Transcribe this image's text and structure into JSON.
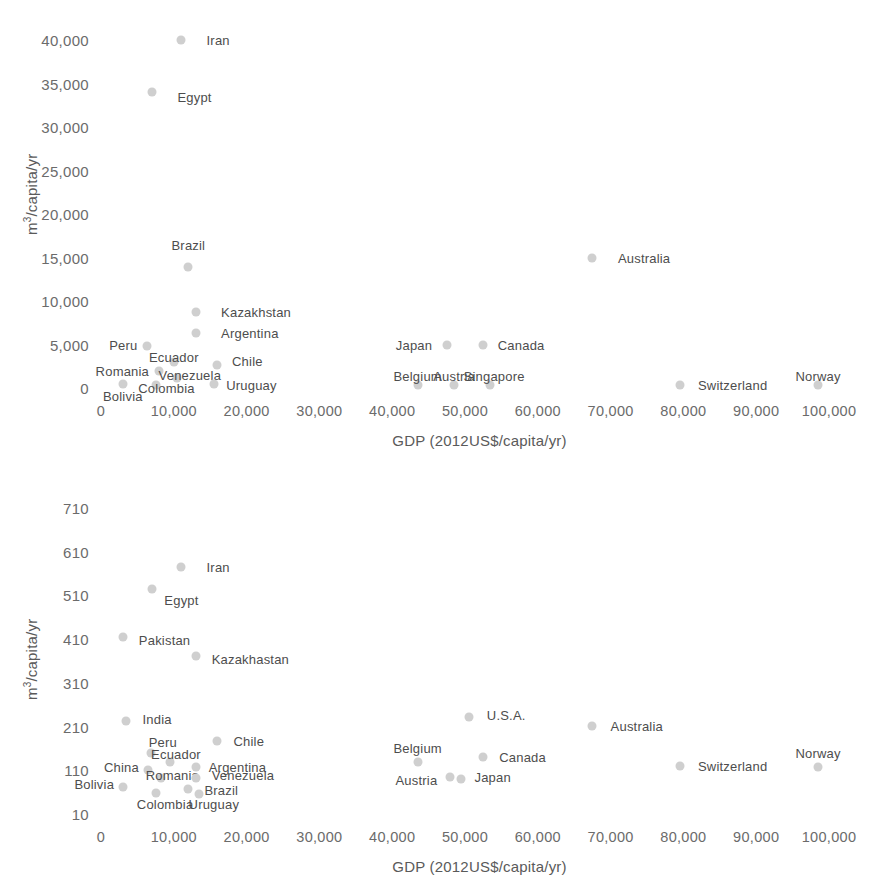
{
  "figure": {
    "background": "#ffffff",
    "marker_color": "#cfcfcf",
    "label_color": "#4d4d4d",
    "tick_color": "#6b6b6b"
  },
  "chart_data": [
    {
      "type": "scatter",
      "title": "",
      "xlabel": "GDP (2012US$/capita/yr)",
      "ylabel": "m3/capita/yr",
      "ylabel_html": "m<sup>3</sup>/capita/yr",
      "xlim": [
        0,
        100000
      ],
      "ylim": [
        0,
        40000
      ],
      "xticks": [
        "0",
        "10,000",
        "20,000",
        "30,000",
        "40,000",
        "50,000",
        "60,000",
        "70,000",
        "80,000",
        "90,000",
        "100,000"
      ],
      "xtick_values": [
        0,
        10000,
        20000,
        30000,
        40000,
        50000,
        60000,
        70000,
        80000,
        90000,
        100000
      ],
      "yticks": [
        "0",
        "5,000",
        "10,000",
        "15,000",
        "20,000",
        "25,000",
        "30,000",
        "35,000",
        "40,000"
      ],
      "ytick_values": [
        0,
        5000,
        10000,
        15000,
        20000,
        25000,
        30000,
        35000,
        40000
      ],
      "grid": false,
      "legend": "none",
      "points": [
        {
          "label": "Iran",
          "x": 11000,
          "y": 40000,
          "lx": 14500,
          "ly": 40000,
          "align": "right"
        },
        {
          "label": "Egypt",
          "x": 7000,
          "y": 34000,
          "lx": 10500,
          "ly": 33400,
          "align": "right"
        },
        {
          "label": "Brazil",
          "x": 12000,
          "y": 13900,
          "lx": 12000,
          "ly": 16400,
          "align": "center"
        },
        {
          "label": "Australia",
          "x": 67500,
          "y": 15000,
          "lx": 71000,
          "ly": 15000,
          "align": "right"
        },
        {
          "label": "Kazakhstan",
          "x": 13000,
          "y": 8700,
          "lx": 16500,
          "ly": 8700,
          "align": "right"
        },
        {
          "label": "Argentina",
          "x": 13000,
          "y": 6300,
          "lx": 16500,
          "ly": 6300,
          "align": "right"
        },
        {
          "label": "Peru",
          "x": 6300,
          "y": 4800,
          "lx": 5000,
          "ly": 5000,
          "align": "left"
        },
        {
          "label": "Japan",
          "x": 47500,
          "y": 5000,
          "lx": 45500,
          "ly": 5000,
          "align": "left"
        },
        {
          "label": "Canada",
          "x": 52500,
          "y": 5000,
          "lx": 54500,
          "ly": 5000,
          "align": "right"
        },
        {
          "label": "Ecuador",
          "x": 10000,
          "y": 3000,
          "lx": 10000,
          "ly": 3600,
          "align": "center"
        },
        {
          "label": "Chile",
          "x": 16000,
          "y": 2700,
          "lx": 18000,
          "ly": 3100,
          "align": "right"
        },
        {
          "label": "Romania",
          "x": 8000,
          "y": 2000,
          "lx": 6600,
          "ly": 2000,
          "align": "left"
        },
        {
          "label": "Venezuela",
          "x": 10500,
          "y": 1200,
          "lx": 12200,
          "ly": 1500,
          "align": "center"
        },
        {
          "label": "Belgium",
          "x": 43500,
          "y": 300,
          "lx": 43500,
          "ly": 1400,
          "align": "center"
        },
        {
          "label": "Austria",
          "x": 48500,
          "y": 300,
          "lx": 48500,
          "ly": 1400,
          "align": "center"
        },
        {
          "label": "Singapore",
          "x": 53500,
          "y": 300,
          "lx": 54000,
          "ly": 1400,
          "align": "center"
        },
        {
          "label": "Uruguay",
          "x": 15500,
          "y": 500,
          "lx": 17200,
          "ly": 300,
          "align": "right"
        },
        {
          "label": "Colombia",
          "x": 7500,
          "y": 300,
          "lx": 9000,
          "ly": 0,
          "align": "center"
        },
        {
          "label": "Bolivia",
          "x": 3000,
          "y": 500,
          "lx": 3000,
          "ly": -900,
          "align": "center"
        },
        {
          "label": "Switzerland",
          "x": 79500,
          "y": 300,
          "lx": 82000,
          "ly": 300,
          "align": "right"
        },
        {
          "label": "Norway",
          "x": 98500,
          "y": 300,
          "lx": 98500,
          "ly": 1400,
          "align": "center"
        }
      ]
    },
    {
      "type": "scatter",
      "title": "",
      "xlabel": "GDP (2012US$/capita/yr)",
      "ylabel": "m3/capita/yr",
      "ylabel_html": "m<sup>3</sup>/capita/yr",
      "xlim": [
        0,
        100000
      ],
      "ylim": [
        10,
        710
      ],
      "xticks": [
        "0",
        "10,000",
        "20,000",
        "30,000",
        "40,000",
        "50,000",
        "60,000",
        "70,000",
        "80,000",
        "90,000",
        "100,000"
      ],
      "xtick_values": [
        0,
        10000,
        20000,
        30000,
        40000,
        50000,
        60000,
        70000,
        80000,
        90000,
        100000
      ],
      "yticks": [
        "10",
        "110",
        "210",
        "310",
        "410",
        "510",
        "610",
        "710"
      ],
      "ytick_values": [
        10,
        110,
        210,
        310,
        410,
        510,
        610,
        710
      ],
      "grid": false,
      "legend": "none",
      "points": [
        {
          "label": "Iran",
          "x": 11000,
          "y": 575,
          "lx": 14500,
          "ly": 575,
          "align": "right"
        },
        {
          "label": "Egypt",
          "x": 7000,
          "y": 525,
          "lx": 8700,
          "ly": 500,
          "align": "right"
        },
        {
          "label": "Pakistan",
          "x": 3000,
          "y": 415,
          "lx": 5200,
          "ly": 408,
          "align": "right"
        },
        {
          "label": "Kazakhastan",
          "x": 13000,
          "y": 372,
          "lx": 15200,
          "ly": 365,
          "align": "right"
        },
        {
          "label": "India",
          "x": 3500,
          "y": 222,
          "lx": 5700,
          "ly": 228,
          "align": "right"
        },
        {
          "label": "U.S.A.",
          "x": 50500,
          "y": 232,
          "lx": 53000,
          "ly": 237,
          "align": "right"
        },
        {
          "label": "Australia",
          "x": 67500,
          "y": 212,
          "lx": 70000,
          "ly": 212,
          "align": "right"
        },
        {
          "label": "Chile",
          "x": 16000,
          "y": 178,
          "lx": 18200,
          "ly": 178,
          "align": "right"
        },
        {
          "label": "Peru",
          "x": 6800,
          "y": 150,
          "lx": 8500,
          "ly": 175,
          "align": "center"
        },
        {
          "label": "Belgium",
          "x": 43500,
          "y": 130,
          "lx": 43500,
          "ly": 160,
          "align": "center"
        },
        {
          "label": "Canada",
          "x": 52500,
          "y": 140,
          "lx": 54700,
          "ly": 140,
          "align": "right"
        },
        {
          "label": "Norway",
          "x": 98500,
          "y": 118,
          "lx": 98500,
          "ly": 150,
          "align": "center"
        },
        {
          "label": "Ecuador",
          "x": 9500,
          "y": 128,
          "lx": 10300,
          "ly": 148,
          "align": "center"
        },
        {
          "label": "Switzerland",
          "x": 79500,
          "y": 120,
          "lx": 82000,
          "ly": 120,
          "align": "right"
        },
        {
          "label": "Argentina",
          "x": 13000,
          "y": 118,
          "lx": 14800,
          "ly": 118,
          "align": "right"
        },
        {
          "label": "China",
          "x": 6500,
          "y": 110,
          "lx": 5200,
          "ly": 118,
          "align": "left"
        },
        {
          "label": "Romania",
          "x": 8300,
          "y": 92,
          "lx": 9800,
          "ly": 100,
          "align": "center"
        },
        {
          "label": "Venezuela",
          "x": 13000,
          "y": 92,
          "lx": 15200,
          "ly": 100,
          "align": "right"
        },
        {
          "label": "Austria",
          "x": 48000,
          "y": 95,
          "lx": 46200,
          "ly": 88,
          "align": "left"
        },
        {
          "label": "Japan",
          "x": 49500,
          "y": 90,
          "lx": 51300,
          "ly": 95,
          "align": "right"
        },
        {
          "label": "Bolivia",
          "x": 3000,
          "y": 72,
          "lx": 1800,
          "ly": 78,
          "align": "left"
        },
        {
          "label": "Brazil",
          "x": 12000,
          "y": 68,
          "lx": 14200,
          "ly": 65,
          "align": "right"
        },
        {
          "label": "Colombia",
          "x": 7500,
          "y": 58,
          "lx": 8800,
          "ly": 32,
          "align": "center"
        },
        {
          "label": "Uruguay",
          "x": 13500,
          "y": 55,
          "lx": 15500,
          "ly": 32,
          "align": "center"
        }
      ]
    }
  ]
}
